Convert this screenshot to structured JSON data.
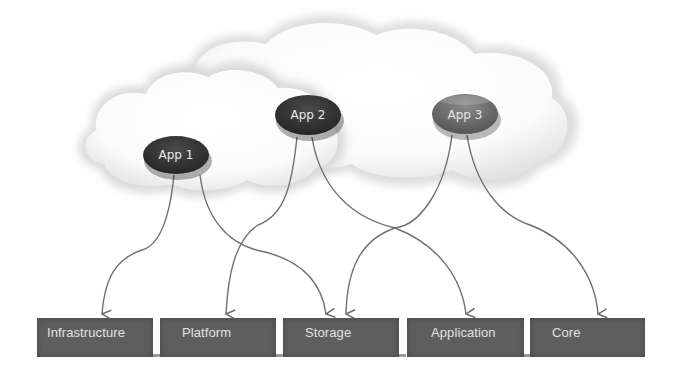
{
  "diagram": {
    "title": "",
    "colors": {
      "cloud": "#e6e6e6",
      "app_dark": "#3a3a3a",
      "app_mid": "#6a6a6a",
      "connector": "#707070",
      "layer_box": "#5e5e5e",
      "layer_text": "#e2e2e2"
    },
    "apps": [
      {
        "id": "app1",
        "label": "App 1"
      },
      {
        "id": "app2",
        "label": "App 2"
      },
      {
        "id": "app3",
        "label": "App 3"
      }
    ],
    "layers": [
      {
        "id": "infrastructure",
        "label": "Infrastructure"
      },
      {
        "id": "platform",
        "label": "Platform"
      },
      {
        "id": "storage",
        "label": "Storage"
      },
      {
        "id": "application",
        "label": "Application"
      },
      {
        "id": "core",
        "label": "Core"
      }
    ],
    "connections": [
      {
        "from": "App 1",
        "to": "Infrastructure"
      },
      {
        "from": "App 1",
        "to": "Storage"
      },
      {
        "from": "App 2",
        "to": "Platform"
      },
      {
        "from": "App 2",
        "to": "Application"
      },
      {
        "from": "App 3",
        "to": "Storage"
      },
      {
        "from": "App 3",
        "to": "Core"
      }
    ],
    "cloud_icon": "cloud-shape"
  }
}
